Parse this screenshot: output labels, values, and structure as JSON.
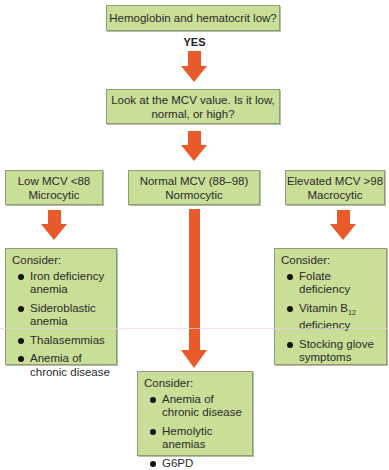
{
  "top_question": "Hemoglobin and hematocrit low?",
  "yes_label": "YES",
  "mcv_question": {
    "line1": "Look at the MCV value. Is it low,",
    "line2": "normal, or high?"
  },
  "branches": {
    "low": {
      "line1": "Low MCV <88",
      "line2": "Microcytic"
    },
    "normal": {
      "line1": "Normal MCV (88–98)",
      "line2": "Normocytic"
    },
    "elevated": {
      "line1": "Elevated MCV >98",
      "line2": "Macrocytic"
    }
  },
  "consider": {
    "low": {
      "title": "Consider:",
      "items": [
        "Iron deficiency anemia",
        "Sideroblastic anemia",
        "Thalasemmias",
        "Anemia of chronic disease"
      ]
    },
    "normal": {
      "title": "Consider:",
      "items": [
        "Anemia of chronic disease",
        "Hemolytic anemias",
        "G6PD"
      ]
    },
    "elevated": {
      "title": "Consider:",
      "items": [
        "Folate deficiency",
        "Vitamin B",
        "Stocking glove symptoms"
      ],
      "vitamin_subscript": "12",
      "vitamin_suffix": "deficiency"
    }
  },
  "colors": {
    "box_fill": "#c9de96",
    "box_border": "#8f9c78",
    "arrow": "#e85a2a"
  }
}
